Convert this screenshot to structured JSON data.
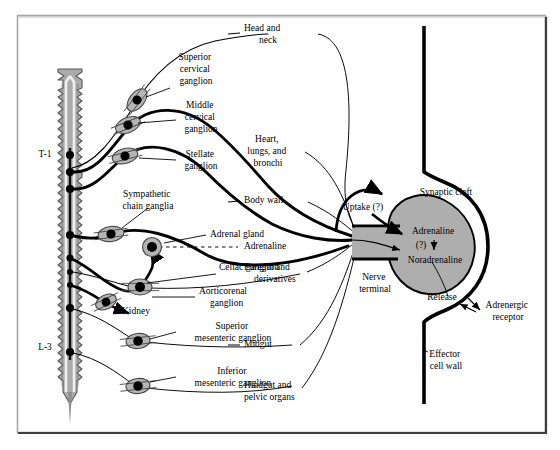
{
  "figure": {
    "width": 560,
    "height": 450,
    "background": "#ffffff",
    "frame_color": "#9a9a9a",
    "frame_shadow_color": "#3a3a3a",
    "ink_color": "#000000",
    "ganglion_fill": "#b3b3b3",
    "cord_fill": "#a8a8a8",
    "terminal_fill": "#a8a8a8"
  },
  "spinal_cord": {
    "name": "spinal-cord",
    "segment_labels": [
      {
        "id": "t1",
        "text": "T-1",
        "x": 45,
        "y": 155
      },
      {
        "id": "l3",
        "text": "L-3",
        "x": 45,
        "y": 348
      }
    ]
  },
  "ganglia": [
    {
      "id": "superior-cervical",
      "label": "Superior\ncervical\nganglion",
      "lines": [
        "Superior",
        "cervical",
        "ganglion"
      ],
      "label_x": 196,
      "label_y": 66,
      "node_x": 137,
      "node_y": 100,
      "angle": -52
    },
    {
      "id": "middle-cervical",
      "label": "Middle\ncervical\nganglion",
      "lines": [
        "Middle",
        "cervical",
        "ganglion"
      ],
      "label_x": 200,
      "label_y": 112,
      "node_x": 128,
      "node_y": 125,
      "angle": -28
    },
    {
      "id": "stellate",
      "label": "Stellate\nganglion",
      "lines": [
        "Stellate",
        "ganglion"
      ],
      "label_x": 200,
      "label_y": 158,
      "node_x": 125,
      "node_y": 155,
      "angle": -20
    },
    {
      "id": "sympathetic-chain",
      "label": "Sympathetic\nchain ganglia",
      "lines": [
        "Sympathetic",
        "chain ganglia"
      ],
      "label_x": 148,
      "label_y": 198,
      "node_x": 111,
      "node_y": 234,
      "angle": -12
    },
    {
      "id": "adrenal-gland",
      "label": "Adrenal gland",
      "lines": [
        "Adrenal gland"
      ],
      "label_x": 248,
      "label_y": 235,
      "node_x": 152,
      "node_y": 247,
      "angle": 0
    },
    {
      "id": "celiac",
      "label": "Celiac ganglion",
      "lines": [
        "Celiac ganglion"
      ],
      "label_x": 248,
      "label_y": 267,
      "node_x": 140,
      "node_y": 287,
      "angle": 0
    },
    {
      "id": "aorticorenal",
      "label": "Aorticorenal\nganglion",
      "lines": [
        "Aorticorenal",
        "ganglion"
      ],
      "label_x": 248,
      "label_y": 297,
      "node_x": 107,
      "node_y": 303,
      "angle": -22
    },
    {
      "id": "superior-mesenteric",
      "label": "Superior\nmesenteric ganglion",
      "lines": [
        "Superior",
        "mesenteric ganglion"
      ],
      "label_x": 232,
      "label_y": 333,
      "node_x": 138,
      "node_y": 341,
      "angle": -8
    },
    {
      "id": "inferior-mesenteric",
      "label": "Inferior\nmesenteric ganglion",
      "lines": [
        "Inferior",
        "mesenteric ganglion"
      ],
      "label_x": 232,
      "label_y": 378,
      "node_x": 138,
      "node_y": 386,
      "angle": -8
    }
  ],
  "organ_targets": [
    {
      "id": "head-and-neck",
      "lines": [
        "Head and",
        "neck"
      ],
      "x": 268,
      "y": 35
    },
    {
      "id": "heart-lungs-bronchi",
      "lines": [
        "Heart,",
        "lungs, and",
        "bronchi"
      ],
      "x": 268,
      "y": 152
    },
    {
      "id": "body-wall",
      "lines": [
        "Body wall"
      ],
      "x": 268,
      "y": 202
    },
    {
      "id": "adrenaline",
      "lines": [
        "Adrenaline"
      ],
      "x": 268,
      "y": 246
    },
    {
      "id": "foregut-and-derivatives",
      "lines": [
        "Foregut and",
        "derivatives"
      ],
      "x": 268,
      "y": 272
    },
    {
      "id": "midgut",
      "lines": [
        "Midgut"
      ],
      "x": 268,
      "y": 345
    },
    {
      "id": "hindgut-and-pelvic-organs",
      "lines": [
        "Hindgut and",
        "pelvic organs"
      ],
      "x": 268,
      "y": 392
    }
  ],
  "kidney": {
    "id": "kidney",
    "text": "Kidney",
    "x": 121,
    "y": 312
  },
  "synapse": {
    "name": "adrenergic-synapse",
    "labels": [
      {
        "id": "synaptic-cleft",
        "lines": [
          "Synaptic cleft"
        ],
        "x": 446,
        "y": 193,
        "anchor": "middle"
      },
      {
        "id": "uptake",
        "lines": [
          "Uptake (?)"
        ],
        "x": 363,
        "y": 207,
        "anchor": "middle"
      },
      {
        "id": "adrenaline-terminal",
        "lines": [
          "Adrenaline"
        ],
        "x": 432,
        "y": 232,
        "anchor": "middle"
      },
      {
        "id": "question-arrow",
        "lines": [
          "(?)"
        ],
        "x": 423,
        "y": 246,
        "anchor": "middle"
      },
      {
        "id": "noradrenaline",
        "lines": [
          "Noradrenaline"
        ],
        "x": 434,
        "y": 259,
        "anchor": "middle"
      },
      {
        "id": "nerve-terminal",
        "lines": [
          "Nerve",
          "terminal"
        ],
        "x": 375,
        "y": 283,
        "anchor": "middle"
      },
      {
        "id": "release",
        "lines": [
          "Release"
        ],
        "x": 442,
        "y": 297,
        "anchor": "middle"
      },
      {
        "id": "adrenergic-receptor",
        "lines": [
          "Adrenergic",
          "receptor"
        ],
        "x": 505,
        "y": 311,
        "anchor": "middle"
      },
      {
        "id": "effector-cell-wall",
        "lines": [
          "Effector",
          "cell wall"
        ],
        "x": 441,
        "y": 360,
        "anchor": "middle"
      }
    ]
  }
}
